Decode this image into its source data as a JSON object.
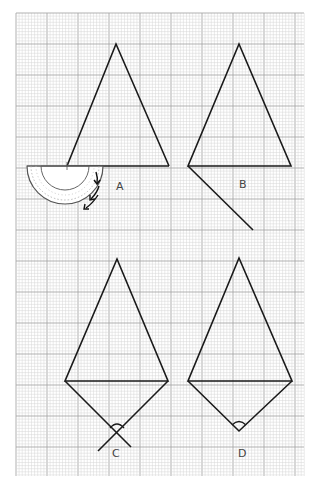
{
  "figure": {
    "grid": {
      "x": 16,
      "y": 13,
      "width": 288,
      "height": 463,
      "minor": 3.1,
      "major": 31,
      "minor_color": "#d6d6d6",
      "major_color": "#a8a8a8"
    },
    "line_color": "#1a1a1a",
    "panels": [
      {
        "id": "A",
        "label": "A",
        "label_pos": [
          121,
          188
        ],
        "triangle": [
          [
            116,
            44
          ],
          [
            67,
            166
          ],
          [
            169,
            166
          ]
        ],
        "note": "protractor placed at base-left vertex with arrows showing rotation"
      },
      {
        "id": "B",
        "label": "B",
        "label_pos": [
          244,
          186
        ],
        "triangle": [
          [
            239,
            44
          ],
          [
            188,
            166
          ],
          [
            291,
            166
          ]
        ],
        "extension_line": [
          [
            188,
            166
          ],
          [
            253,
            230
          ]
        ]
      },
      {
        "id": "C",
        "label": "C",
        "label_pos": [
          116,
          456
        ],
        "triangle": [
          [
            117,
            259
          ],
          [
            65,
            381
          ],
          [
            168,
            381
          ]
        ],
        "lines": [
          [
            [
              65,
              381
            ],
            [
              131,
              447
            ]
          ],
          [
            [
              168,
              381
            ],
            [
              98,
              451
            ]
          ]
        ],
        "arc_center": [
          117,
          432
        ]
      },
      {
        "id": "D",
        "label": "D",
        "label_pos": [
          242,
          456
        ],
        "triangle": [
          [
            239,
            258
          ],
          [
            188,
            381
          ],
          [
            292,
            381
          ]
        ],
        "lines": [
          [
            [
              188,
              381
            ],
            [
              239,
              431
            ]
          ],
          [
            [
              292,
              381
            ],
            [
              239,
              431
            ]
          ]
        ],
        "arc_center": [
          239,
          431
        ]
      }
    ]
  }
}
